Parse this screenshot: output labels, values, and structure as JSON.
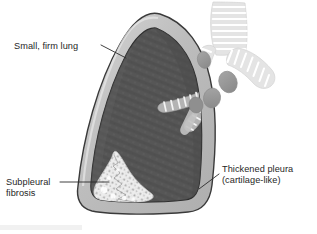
{
  "figure": {
    "background_color": "#ffffff",
    "width": 317,
    "height": 234
  },
  "palette": {
    "lung_parenchyma": "#565656",
    "lung_parenchyma_shadow": "#4a4a4a",
    "pleura_band": "#b9b9b9",
    "pleura_band_light": "#d2d2d2",
    "outline": "#3a3a3a",
    "airway_ring": "#c9c9c9",
    "airway_lumen": "#f2f2f2",
    "lymph_node": "#9a9a9a",
    "fibrosis": "#ececec",
    "fibrosis_speckle": "#9e9e9e",
    "label_text": "#262626",
    "leader_line": "#2b2b2b",
    "scan_artifact": "#f0f0f0"
  },
  "labels": [
    {
      "id": "small-firm-lung",
      "lines": [
        "Small, firm lung"
      ],
      "x": 14,
      "y": 49,
      "anchor": "start",
      "leader": "M 101 45 L 126 58"
    },
    {
      "id": "subpleural-fibrosis",
      "lines": [
        "Subpleural",
        "fibrosis"
      ],
      "x": 6,
      "y": 185,
      "anchor": "start",
      "leader": "M 60 182 L 109 182"
    },
    {
      "id": "thickened-pleura",
      "lines": [
        "Thickened pleura",
        "(cartilage-like)"
      ],
      "x": 222,
      "y": 178,
      "anchor": "start",
      "leader": "M 219 174 L 199 189"
    }
  ],
  "anatomy": {
    "lung": {
      "name": "fibrotic lung cross-section",
      "description": "Small firm lung with dark parenchyma encased in a thick pale pleural rind"
    },
    "pleura": {
      "name": "thickened visceral pleura",
      "description": "Pale cartilage-like band surrounding the lung"
    },
    "trachea": {
      "name": "trachea with cartilage rings",
      "ring_count": 9
    },
    "main_bronchi": {
      "name": "main bronchi with cartilage rings",
      "branch_count": 2
    },
    "intrapulmonary_bronchi": {
      "name": "intrapulmonary bronchi",
      "branch_count": 3
    },
    "lymph_nodes": {
      "name": "hilar lymph nodes",
      "count": 4
    },
    "fibrosis": {
      "name": "subpleural fibrosis",
      "description": "Irregular pale mottled region at the lung base beneath the pleura"
    }
  }
}
